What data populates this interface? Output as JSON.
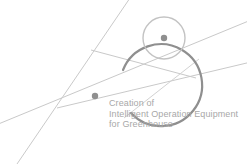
{
  "logo": {
    "title_lines": [
      "Creation of",
      "Intelligent Operation Equipment",
      "for Greenhouse"
    ],
    "colors": {
      "background": "#ffffff",
      "large_arc": "#8f8f8f",
      "small_circle": "#c3c3c3",
      "lines": "#c9c9c9",
      "center_dots": "#8f8f8f",
      "text": "#a8a8a8"
    },
    "shapes": {
      "large_arc": {
        "name": "large-arc",
        "center_x": 95,
        "center_y": 96,
        "radius": 41,
        "gap": true
      },
      "small_circle": {
        "name": "small-circle",
        "center_x": 164,
        "center_y": 38,
        "radius": 21
      },
      "large_center_dot": {
        "center_x": 95,
        "center_y": 96,
        "radius": 3
      },
      "small_center_dot": {
        "center_x": 164,
        "center_y": 38,
        "radius": 3
      },
      "line_count": 4,
      "convergence_point": {
        "x": 93,
        "y": 53
      },
      "intersection_point": {
        "x": 57,
        "y": 108
      }
    }
  }
}
